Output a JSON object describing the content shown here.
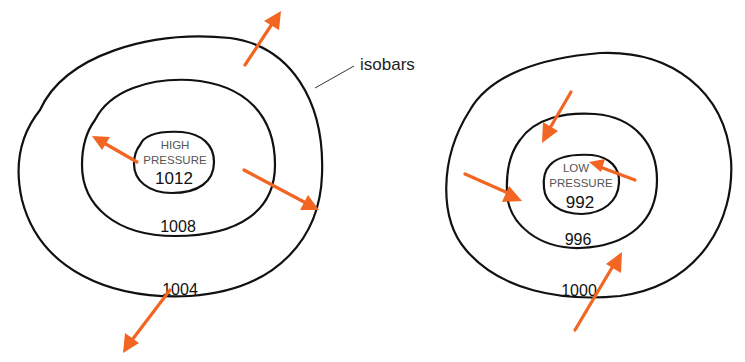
{
  "diagram": {
    "colors": {
      "isobar": "#111111",
      "arrow": "#f26522",
      "callout_text": "#222222"
    },
    "callout": {
      "label": "isobars"
    },
    "high_system": {
      "title_line1": "HIGH",
      "title_line2": "PRESSURE",
      "center_value": "1012",
      "isobars": [
        "1012",
        "1008",
        "1004"
      ],
      "middle_label": "1008",
      "outer_label": "1004",
      "wind_direction": "outward"
    },
    "low_system": {
      "title_line1": "LOW",
      "title_line2": "PRESSURE",
      "center_value": "992",
      "isobars": [
        "992",
        "996",
        "1000"
      ],
      "middle_label": "996",
      "outer_label": "1000",
      "wind_direction": "inward"
    }
  }
}
